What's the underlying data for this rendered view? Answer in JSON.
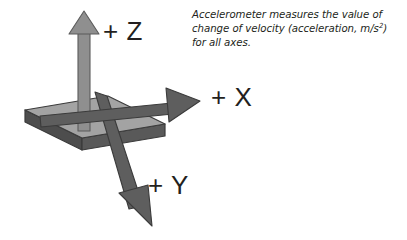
{
  "figure": {
    "title_alt": "Accelerometer axes diagram",
    "caption": {
      "line1": "Accelerometer measures the value of",
      "line2_pre": "change of velocity (acceleration, m/s",
      "line2_sup": "2",
      "line2_post": ")",
      "line3": "for all axes."
    },
    "labels": {
      "z": "+ Z",
      "x": "+ X",
      "y": "+ Y"
    },
    "colors": {
      "background": "#ffffff",
      "text": "#231f20",
      "slab_top": "#a0a0a0",
      "slab_front": "#595959",
      "slab_side": "#4d4d4d",
      "slab_outline": "#3b3b3b",
      "z_arrow": "#8c8c8c",
      "z_arrow_outline": "#5b5b5b",
      "xy_arrow": "#5e5e5e",
      "xy_arrow_outline": "#3b3b3b"
    },
    "geometry": {
      "z_axis": {
        "tip": [
          84,
          12
        ],
        "base": [
          84,
          131
        ],
        "direction": "up"
      },
      "x_axis": {
        "tip": [
          200,
          101
        ],
        "base": [
          47,
          117
        ],
        "direction": "right-up"
      },
      "y_axis": {
        "tip": [
          152,
          226
        ],
        "base": [
          100,
          94
        ],
        "direction": "down-right"
      },
      "slab_top_face": [
        [
          25,
          110
        ],
        [
          108,
          96
        ],
        [
          165,
          124
        ],
        [
          82,
          138
        ]
      ],
      "slab_thickness": 12
    }
  }
}
